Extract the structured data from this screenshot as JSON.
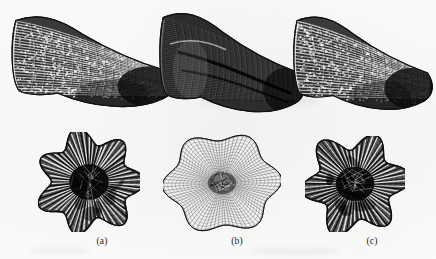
{
  "figure": {
    "kind": "scientific-plate",
    "background_color": "#fdfdfc",
    "ink_color": "#1b1b1b",
    "panel_count": 3,
    "row_count": 2,
    "row_labels": [
      "lateral view",
      "calyx view"
    ]
  },
  "captions": [
    {
      "id": "a",
      "label": "(a)",
      "x": 82,
      "y": 236
    },
    {
      "id": "b",
      "label": "(b)",
      "x": 217,
      "y": 236
    },
    {
      "id": "c",
      "label": "(c)",
      "x": 352,
      "y": 236
    }
  ],
  "specimens": [
    {
      "id": "a",
      "views": [
        {
          "view": "lateral",
          "name": "specimen-a-lateral",
          "x": 10,
          "y": 10,
          "w": 165,
          "h": 105,
          "tone": "dark-mottled",
          "texture": "coarse-reticulate",
          "ribs": 26,
          "growth_bands": 17
        },
        {
          "view": "calyx",
          "name": "specimen-a-calyx",
          "x": 38,
          "y": 132,
          "w": 102,
          "h": 100,
          "tone": "dark",
          "texture": "coarse-radial",
          "septa": 58,
          "lobes": 7,
          "lobe_depth": 0.17
        }
      ]
    },
    {
      "id": "b",
      "views": [
        {
          "view": "lateral",
          "name": "specimen-b-lateral",
          "x": 158,
          "y": 6,
          "w": 148,
          "h": 115,
          "tone": "very-dark-solid",
          "texture": "fine-striate",
          "ribs": 40,
          "growth_bands": 22
        },
        {
          "view": "calyx",
          "name": "specimen-b-calyx",
          "x": 163,
          "y": 132,
          "w": 118,
          "h": 102,
          "tone": "light",
          "texture": "fine-reticulate",
          "septa": 84,
          "lobes": 6,
          "lobe_depth": 0.1
        }
      ]
    },
    {
      "id": "c",
      "views": [
        {
          "view": "lateral",
          "name": "specimen-c-lateral",
          "x": 292,
          "y": 10,
          "w": 142,
          "h": 108,
          "tone": "dark-mottled",
          "texture": "coarse-reticulate",
          "ribs": 24,
          "growth_bands": 16
        },
        {
          "view": "calyx",
          "name": "specimen-c-calyx",
          "x": 305,
          "y": 136,
          "w": 100,
          "h": 96,
          "tone": "dark",
          "texture": "coarse-radial",
          "septa": 54,
          "lobes": 6,
          "lobe_depth": 0.2
        }
      ]
    }
  ]
}
